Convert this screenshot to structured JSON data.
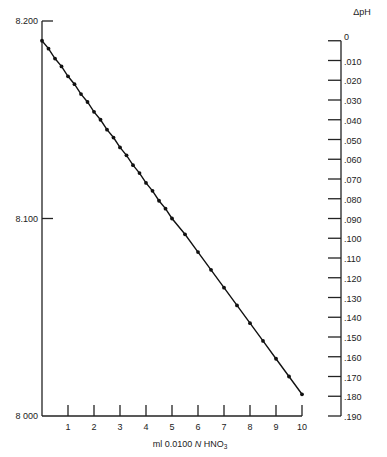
{
  "chart_data": {
    "type": "line",
    "title": "",
    "xlabel": "ml 0.0100 N HNO3",
    "xlabel_parts": {
      "prefix": "ml 0.0100 ",
      "italic": "N",
      "suffix": " HNO",
      "sub": "3"
    },
    "ylabel": "pH",
    "ylim": [
      8.0,
      8.2
    ],
    "xlim": [
      0,
      10
    ],
    "x_ticks": [
      1,
      2,
      3,
      4,
      5,
      6,
      7,
      8,
      9,
      10
    ],
    "y_tick_labels": [
      {
        "value": 8.2,
        "label": "8.200"
      },
      {
        "value": 8.1,
        "label": "8.100"
      },
      {
        "value": 8.0,
        "label": "8 000"
      }
    ],
    "secondary_axis": {
      "label": "ΔpH",
      "origin_value": 8.19,
      "ticks": [
        "0",
        ".010",
        ".020",
        ".030",
        ".040",
        ".050",
        ".060",
        ".070",
        ".080",
        ".090",
        ".100",
        ".110",
        ".120",
        ".130",
        ".140",
        ".150",
        ".160",
        ".170",
        ".180",
        ".190"
      ]
    },
    "grid": false,
    "series": [
      {
        "name": "pH",
        "x": [
          0,
          0.25,
          0.5,
          0.75,
          1,
          1.25,
          1.5,
          1.75,
          2,
          2.25,
          2.5,
          2.75,
          3,
          3.25,
          3.5,
          3.75,
          4,
          4.25,
          4.5,
          4.75,
          5,
          5.5,
          6,
          6.5,
          7,
          7.5,
          8,
          8.5,
          9,
          9.5,
          10
        ],
        "values": [
          8.19,
          8.186,
          8.181,
          8.177,
          8.172,
          8.168,
          8.163,
          8.159,
          8.154,
          8.15,
          8.145,
          8.141,
          8.136,
          8.132,
          8.127,
          8.123,
          8.118,
          8.114,
          8.109,
          8.105,
          8.1,
          8.092,
          8.083,
          8.074,
          8.065,
          8.056,
          8.047,
          8.038,
          8.029,
          8.02,
          8.011
        ]
      }
    ]
  }
}
